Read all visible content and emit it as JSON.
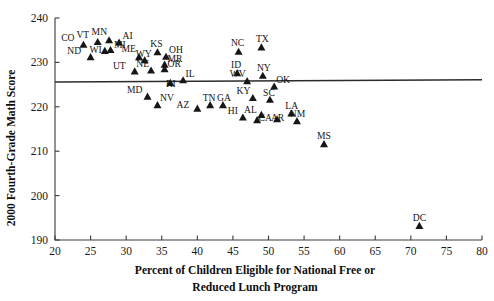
{
  "chart_data": {
    "type": "scatter",
    "title": "",
    "xlabel": "Percent of Children Eligible for National Free or Reduced Lunch Program",
    "xlabel_line1": "Percent of Children Eligible for National Free or",
    "xlabel_line2": "Reduced Lunch Program",
    "ylabel": "2000 Fourth-Grade Math Score",
    "xlim": [
      20,
      80
    ],
    "ylim": [
      190,
      240
    ],
    "xticks": [
      20,
      25,
      30,
      35,
      40,
      45,
      50,
      55,
      60,
      65,
      70,
      75,
      80
    ],
    "yticks": [
      190,
      200,
      210,
      220,
      230,
      240
    ],
    "xtick_labels": [
      "20",
      "25",
      "30",
      "35",
      "40",
      "45",
      "50",
      "55",
      "60",
      "65",
      "70",
      "75",
      "80"
    ],
    "ytick_labels": [
      "190",
      "200",
      "210",
      "220",
      "230",
      "240"
    ],
    "grid": false,
    "legend": "none",
    "marker_shape": "triangle-up",
    "marker_color": "#161616",
    "trend_line": {
      "label": "",
      "x_start": 20,
      "y_start": 225.6,
      "x_end": 80,
      "y_end": 226.1,
      "color": "#2b2b2b"
    },
    "point_label_field": "state",
    "points": [
      {
        "state": "CO",
        "x": 24.0,
        "y": 234.0,
        "lx": -9.0,
        "ly": -4.0
      },
      {
        "state": "VT",
        "x": 26.0,
        "y": 234.6,
        "lx": -8.5,
        "ly": -4.0
      },
      {
        "state": "MN",
        "x": 27.6,
        "y": 235.0,
        "lx": -2.0,
        "ly": -5.0
      },
      {
        "state": "AI",
        "x": 29.0,
        "y": 234.5,
        "lx": 3.5,
        "ly": -3.0
      },
      {
        "state": "ND",
        "x": 25.0,
        "y": 231.2,
        "lx": -9.5,
        "ly": -3.5
      },
      {
        "state": "MI",
        "x": 27.8,
        "y": 232.8,
        "lx": 3.5,
        "ly": -2.0
      },
      {
        "state": "WI",
        "x": 27.0,
        "y": 232.6,
        "lx": -3.0,
        "ly": 2.0
      },
      {
        "state": "ME",
        "x": 31.8,
        "y": 231.2,
        "lx": -3.0,
        "ly": -5.0
      },
      {
        "state": "KS",
        "x": 34.4,
        "y": 232.3,
        "lx": -1.0,
        "ly": -5.5
      },
      {
        "state": "OH",
        "x": 35.6,
        "y": 231.3,
        "lx": 3.0,
        "ly": -3.5
      },
      {
        "state": "WY",
        "x": 32.6,
        "y": 230.5,
        "lx": -1.0,
        "ly": -3.0
      },
      {
        "state": "MR",
        "x": 35.4,
        "y": 229.5,
        "lx": 3.0,
        "ly": -2.5
      },
      {
        "state": "OR",
        "x": 35.4,
        "y": 228.5,
        "lx": 3.0,
        "ly": -2.5
      },
      {
        "state": "UT",
        "x": 31.2,
        "y": 228.0,
        "lx": -9.0,
        "ly": -2.5
      },
      {
        "state": "NE",
        "x": 33.5,
        "y": 228.2,
        "lx": -2.0,
        "ly": -3.0
      },
      {
        "state": "IL",
        "x": 38.0,
        "y": 226.0,
        "lx": 2.5,
        "ly": -3.0
      },
      {
        "state": "MD",
        "x": 33.0,
        "y": 222.3,
        "lx": -5.0,
        "ly": -4.0
      },
      {
        "state": "RI",
        "x": 36.2,
        "y": 225.4,
        "lx": 0.5,
        "ly": 4.5
      },
      {
        "state": "NV",
        "x": 34.4,
        "y": 220.4,
        "lx": 2.5,
        "ly": -4.0
      },
      {
        "state": "NC",
        "x": 45.8,
        "y": 232.4,
        "lx": -1.0,
        "ly": -5.5
      },
      {
        "state": "TX",
        "x": 49.0,
        "y": 233.4,
        "lx": 1.0,
        "ly": -5.5
      },
      {
        "state": "ID",
        "x": 45.6,
        "y": 227.6,
        "lx": -1.0,
        "ly": -5.0
      },
      {
        "state": "AZ",
        "x": 40.0,
        "y": 219.6,
        "lx": -8.0,
        "ly": -1.0
      },
      {
        "state": "TN",
        "x": 41.8,
        "y": 220.4,
        "lx": -1.0,
        "ly": -4.5
      },
      {
        "state": "GA",
        "x": 43.6,
        "y": 220.4,
        "lx": 1.0,
        "ly": -4.5
      },
      {
        "state": "WV",
        "x": 47.0,
        "y": 225.8,
        "lx": -1.5,
        "ly": -4.5
      },
      {
        "state": "NY",
        "x": 49.2,
        "y": 227.0,
        "lx": 1.0,
        "ly": -5.0
      },
      {
        "state": "KY",
        "x": 47.8,
        "y": 222.0,
        "lx": -2.5,
        "ly": -4.0
      },
      {
        "state": "OK",
        "x": 50.8,
        "y": 224.6,
        "lx": 2.0,
        "ly": -3.5
      },
      {
        "state": "SC",
        "x": 50.2,
        "y": 221.6,
        "lx": -1.0,
        "ly": -4.0
      },
      {
        "state": "AL",
        "x": 49.0,
        "y": 218.2,
        "lx": -4.5,
        "ly": -2.0
      },
      {
        "state": "LA",
        "x": 53.2,
        "y": 218.5,
        "lx": 0.5,
        "ly": -4.5
      },
      {
        "state": "HI",
        "x": 46.4,
        "y": 217.6,
        "lx": -5.0,
        "ly": -3.0
      },
      {
        "state": "CA",
        "x": 48.4,
        "y": 217.0,
        "lx": 1.5,
        "ly": 1.0
      },
      {
        "state": "AR",
        "x": 51.2,
        "y": 217.2,
        "lx": 0.5,
        "ly": 1.5
      },
      {
        "state": "NM",
        "x": 54.0,
        "y": 216.8,
        "lx": 0.5,
        "ly": -4.0
      },
      {
        "state": "MS",
        "x": 57.8,
        "y": 211.6,
        "lx": 0.0,
        "ly": -5.0
      },
      {
        "state": "DC",
        "x": 71.2,
        "y": 193.2,
        "lx": 0.0,
        "ly": -5.0
      }
    ]
  },
  "axes": {
    "xlabel_line1": "Percent of Children Eligible for National Free or",
    "xlabel_line2": "Reduced Lunch Program",
    "ylabel": "2000 Fourth-Grade Math Score"
  }
}
